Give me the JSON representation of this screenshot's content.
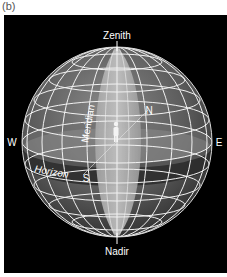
{
  "caption": "(b)",
  "labels": {
    "zenith": "Zenith",
    "nadir": "Nadir",
    "north": "N",
    "south": "S",
    "east": "E",
    "west": "W",
    "meridian": "Meridian",
    "horizon": "Horizon"
  },
  "colors": {
    "background": "#000000",
    "sphere_dark": "#3a3a3a",
    "sphere_light": "#9a9a9a",
    "meridian_band": "#b8b8b8",
    "horizon_band": "#2e2e2e",
    "grid": "#f0f0f0"
  }
}
